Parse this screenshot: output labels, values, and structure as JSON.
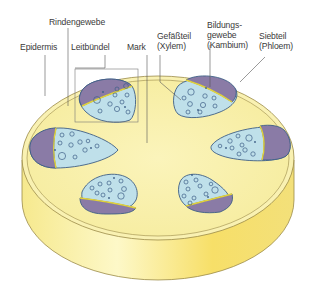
{
  "diagram": {
    "labels": {
      "rindengewebe": "Rindengewebe",
      "epidermis": "Epidermis",
      "leitbuendel": "Leitbündel",
      "mark": "Mark",
      "gefaessteil_line1": "Gefäßteil",
      "gefaessteil_line2": "(Xylem)",
      "bildungsgewebe_line1": "Bildungs-",
      "bildungsgewebe_line2": "gewebe",
      "bildungsgewebe_line3": "(Kambium)",
      "siebteil_line1": "Siebteil",
      "siebteil_line2": "(Phloem)"
    },
    "colors": {
      "stem_top": "#f8f0b0",
      "stem_side_light": "#fdf7c4",
      "stem_side_dark": "#f5dc6a",
      "outline": "#8a7a3a",
      "xylem": "#bfe0ea",
      "phloem": "#8a7ba6",
      "cambium": "#e3d23a",
      "vessel_outline": "#3e5f86",
      "leader_line": "#555555"
    },
    "bundle_count": 6
  }
}
